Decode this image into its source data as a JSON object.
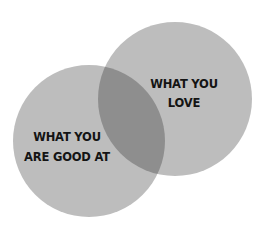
{
  "diagram": {
    "type": "venn",
    "colors": {
      "background": "#ffffff",
      "circle_fill": "#bdbdbd",
      "overlap_fill": "#8e8e8e",
      "text": "#141414"
    },
    "circles": [
      {
        "id": "good",
        "label_lines": [
          "WHAT YOU",
          "ARE GOOD AT"
        ]
      },
      {
        "id": "love",
        "label_lines": [
          "WHAT YOU",
          "LOVE"
        ]
      }
    ]
  }
}
